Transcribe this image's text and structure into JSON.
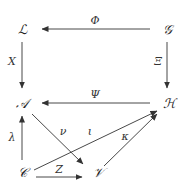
{
  "nodes": {
    "L": "ℒ",
    "G": "𝒢",
    "A": "𝒜",
    "H": "ℋ",
    "C": "𝒞",
    "V": "𝒱"
  },
  "edges": [
    {
      "id": "phi",
      "from": "G",
      "to": "L",
      "label": "Φ"
    },
    {
      "id": "x",
      "from": "L",
      "to": "A",
      "label": "X"
    },
    {
      "id": "xi",
      "from": "G",
      "to": "H",
      "label": "Ξ"
    },
    {
      "id": "psi",
      "from": "H",
      "to": "A",
      "label": "Ψ"
    },
    {
      "id": "lambda",
      "from": "C",
      "to": "A",
      "label": "λ"
    },
    {
      "id": "nu",
      "from": "A",
      "to": "V",
      "label": "ν"
    },
    {
      "id": "iota",
      "from": "C",
      "to": "H",
      "label": "ι"
    },
    {
      "id": "kappa",
      "from": "V",
      "to": "H",
      "label": "κ"
    },
    {
      "id": "z",
      "from": "C",
      "to": "V",
      "label": "Z"
    }
  ],
  "colors": {
    "ink": "#333333",
    "background": "#ffffff"
  }
}
